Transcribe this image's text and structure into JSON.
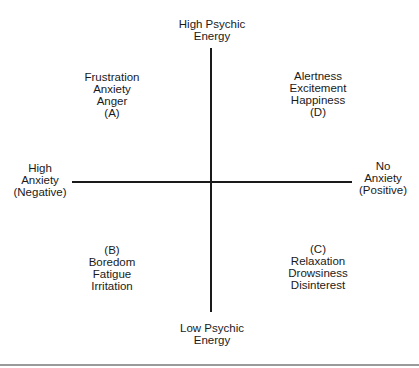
{
  "axes": {
    "top": [
      "High Psychic",
      "Energy"
    ],
    "bottom": [
      "Low Psychic",
      "Energy"
    ],
    "left": [
      "High",
      "Anxiety",
      "(Negative)"
    ],
    "right": [
      "No",
      "Anxiety",
      "(Positive)"
    ]
  },
  "quadrants": {
    "A": [
      "Frustration",
      "Anxiety",
      "Anger",
      "(A)"
    ],
    "D": [
      "Alertness",
      "Excitement",
      "Happiness",
      "(D)"
    ],
    "B": [
      "(B)",
      "Boredom",
      "Fatigue",
      "Irritation"
    ],
    "C": [
      "(C)",
      "Relaxation",
      "Drowsiness",
      "Disinterest"
    ]
  }
}
